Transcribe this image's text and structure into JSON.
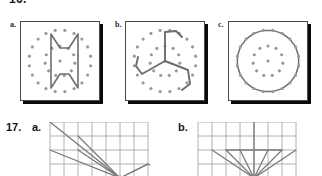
{
  "page": {
    "header_cut_text": "16.",
    "background": "#ffffff",
    "ink_color": "#2b2b2b",
    "line_color": "#6e6e6e",
    "dot_color": "#9a9a9a",
    "grid_color": "#a9a9a9",
    "frame_border_color": "#4a4a4a",
    "shadow_color": "#0a0a0a"
  },
  "figure_row": {
    "panels": [
      {
        "label": "a.",
        "caption_name": "dot-pattern-panel-a",
        "description": "Two concentric rings of dots with an hourglass / I-beam style closed figure drawn through inner dots",
        "dots": {
          "outer_ring": {
            "count": 20,
            "radius": 31
          },
          "inner_ring": {
            "count": 11,
            "radius": 15
          },
          "center_dot": true
        },
        "figure": {
          "type": "closed-polyline",
          "points": "30,12 39,26 48,26 57,12 57,66 48,52 39,52 30,66 30,12"
        }
      },
      {
        "label": "b.",
        "caption_name": "dot-pattern-panel-b",
        "description": "Two concentric rings of dots with a three-armed pinwheel / spiral figure radiating from the centre, each arm ending in a hook",
        "dots": {
          "outer_ring": {
            "count": 20,
            "radius": 31
          },
          "inner_ring": {
            "count": 11,
            "radius": 15
          },
          "center_dot": true
        },
        "figure": {
          "type": "three-arm-pinwheel",
          "arms": [
            "39,39 39,10 50,9 56,15",
            "39,39 16,52 10,44 12,35",
            "39,39 62,48 64,62 56,68"
          ]
        }
      },
      {
        "label": "c.",
        "caption_name": "dot-pattern-panel-c",
        "description": "Two concentric rings of dots, the outer ring joined point to point forming a regular 20-sided polygon (near-circle)",
        "dots": {
          "outer_ring": {
            "count": 20,
            "radius": 31
          },
          "inner_ring": {
            "count": 11,
            "radius": 15
          },
          "center_dot": true
        },
        "figure": {
          "type": "regular-polygon",
          "sides": 20,
          "radius": 31
        }
      }
    ]
  },
  "item_17": {
    "number": "17.",
    "panels": [
      {
        "label": "a.",
        "caption_name": "grid-panel-17a",
        "description": "Rectangular grid with a fan of line segments converging at a point on the lower grid line, plus a quadrilateral to the right; figure is cut off at the bottom of the page",
        "grid": {
          "columns": 7,
          "rows": 4,
          "cell": 14
        },
        "vertex": "70,56",
        "rays": [
          "0,0 70,56",
          "28,14 70,56",
          "28,28 70,56",
          "0,28 70,56"
        ],
        "polygon": "70,56 98,42 112,49 105,60 84,62 70,56"
      },
      {
        "label": "b.",
        "caption_name": "grid-panel-17b",
        "description": "Rectangular grid with a symmetric fan of seven line segments converging at a point on the lower grid line; figure is cut off at the bottom of the page",
        "grid": {
          "columns": 7,
          "rows": 4,
          "cell": 14
        },
        "vertex": "56,56",
        "rays": [
          "56,56 14,28",
          "56,56 28,28",
          "56,56 42,28",
          "56,56 56,0",
          "56,56 70,28",
          "56,56 84,28",
          "56,56 98,28"
        ],
        "connectors": [
          "28,28 84,28"
        ]
      }
    ]
  }
}
